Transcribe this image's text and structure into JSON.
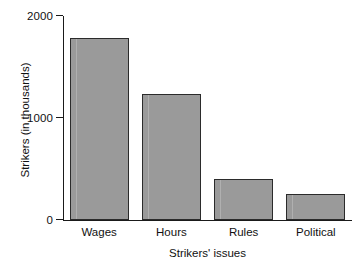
{
  "chart_data": {
    "type": "bar",
    "title": "",
    "xlabel": "Strikers' issues",
    "ylabel": "Strikers (in thousands)",
    "categories": [
      "Wages",
      "Hours",
      "Rules",
      "Political"
    ],
    "values": [
      1780,
      1240,
      400,
      255
    ],
    "ylim": [
      0,
      2000
    ],
    "yticks": [
      0,
      1000,
      2000
    ],
    "ytick_labels": [
      "0",
      "1000",
      "2000"
    ],
    "grid": false,
    "legend": null,
    "series": [
      {
        "name": "Strikers",
        "values": [
          1780,
          1240,
          400,
          255
        ]
      }
    ],
    "colors": {
      "bar_fill": "#9a9a9a",
      "bar_edge": "#2b2b2b",
      "axis": "#1a1a1a",
      "text": "#111111",
      "background": "#ffffff"
    }
  },
  "axes": {
    "y": {
      "ticks": [
        {
          "label": "2000",
          "value": 2000
        },
        {
          "label": "1000",
          "value": 1000
        },
        {
          "label": "0",
          "value": 0
        }
      ],
      "title": "Strikers (in thousands)"
    },
    "x": {
      "title": "Strikers' issues",
      "categories": [
        {
          "label": "Wages"
        },
        {
          "label": "Hours"
        },
        {
          "label": "Rules"
        },
        {
          "label": "Political"
        }
      ]
    }
  }
}
